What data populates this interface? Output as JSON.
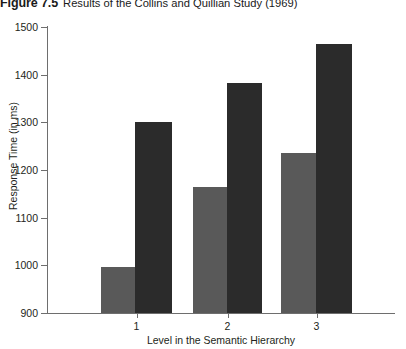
{
  "figure": {
    "number_label": "Figure 7.5",
    "caption": "Results of the Collins and Quillian Study (1969)"
  },
  "colors": {
    "series_light": "#595959",
    "series_dark": "#2b2b2b",
    "axis": "#6e6e6e",
    "text": "#231f20",
    "background": "#ffffff"
  },
  "chart_data": {
    "type": "bar",
    "title": "Results of the Collins and Quillian Study (1969)",
    "xlabel": "Level in the Semantic Hierarchy",
    "ylabel": "Response Time (in ms)",
    "categories": [
      "1",
      "2",
      "3"
    ],
    "ylim": [
      900,
      1500
    ],
    "yticks": [
      900,
      1000,
      1100,
      1200,
      1300,
      1400,
      1500
    ],
    "ytick_labels": [
      "900",
      "1000",
      "1100",
      "1200",
      "1300",
      "1400",
      "1500"
    ],
    "grid": false,
    "legend": "none",
    "series": [
      {
        "name": "light",
        "color": "#595959",
        "values": [
          997,
          1165,
          1236
        ]
      },
      {
        "name": "dark",
        "color": "#2b2b2b",
        "values": [
          1301,
          1383,
          1465
        ]
      }
    ]
  }
}
